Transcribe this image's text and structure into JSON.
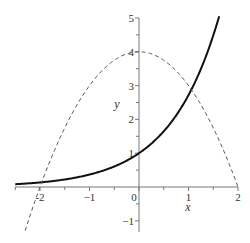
{
  "chart_data": {
    "type": "line",
    "title": "",
    "xlabel": "x",
    "ylabel": "y",
    "xlim": [
      -2.5,
      2.0
    ],
    "ylim": [
      -1.33,
      5.0
    ],
    "grid": false,
    "legend": null,
    "x_ticks": [
      -2,
      -1,
      0,
      1,
      2
    ],
    "y_ticks": [
      -1,
      1,
      2,
      3,
      4,
      5
    ],
    "x_tick_labels": [
      "-2",
      "−1",
      "0",
      "1",
      "2"
    ],
    "y_tick_labels": [
      "−1",
      "1",
      "2",
      "3",
      "4",
      "5"
    ],
    "series": [
      {
        "name": "y = e^x",
        "style": "solid",
        "color": "#111111",
        "width": 2,
        "formula": "exp(x)",
        "x_range": [
          -2.5,
          1.62
        ],
        "points": [
          [
            -2.5,
            0.08
          ],
          [
            -2,
            0.14
          ],
          [
            -1.5,
            0.22
          ],
          [
            -1,
            0.37
          ],
          [
            -0.5,
            0.61
          ],
          [
            0,
            1.0
          ],
          [
            0.5,
            1.65
          ],
          [
            1,
            2.72
          ],
          [
            1.5,
            4.48
          ],
          [
            1.62,
            5.05
          ]
        ]
      },
      {
        "name": "y = 4 - x^2",
        "style": "dashed",
        "color": "#555555",
        "width": 1,
        "formula": "4 - x^2",
        "x_range": [
          -2.3,
          2.0
        ],
        "points": [
          [
            -2.3,
            -1.29
          ],
          [
            -2,
            0
          ],
          [
            -1.5,
            1.75
          ],
          [
            -1,
            3
          ],
          [
            -0.5,
            3.75
          ],
          [
            0,
            4
          ],
          [
            0.5,
            3.75
          ],
          [
            1,
            3
          ],
          [
            1.5,
            1.75
          ],
          [
            2,
            0
          ]
        ]
      }
    ]
  },
  "layout": {
    "origin_px": [
      139,
      187
    ],
    "px_per_unit_x": 49.5,
    "px_per_unit_y": 33.8
  }
}
